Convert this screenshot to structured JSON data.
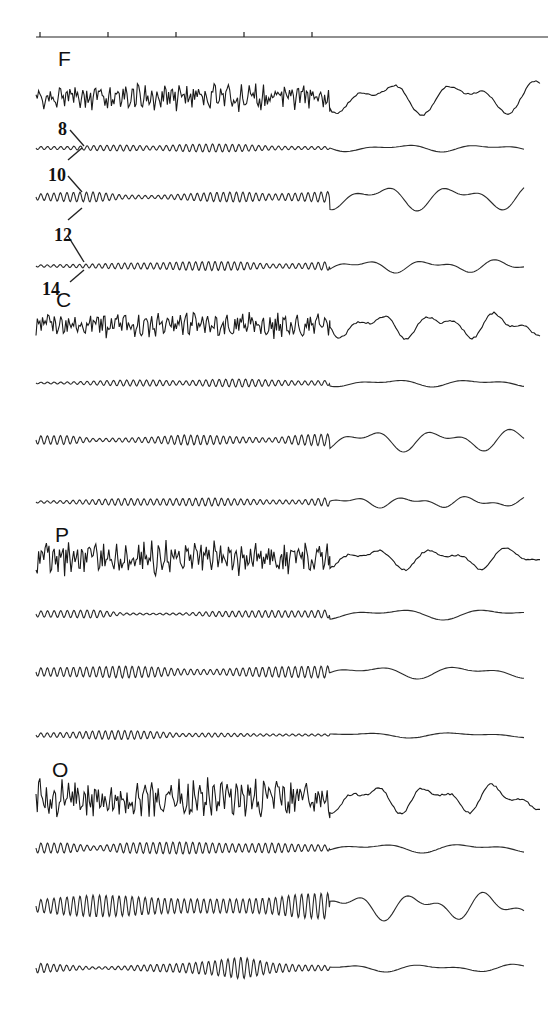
{
  "figure": {
    "time_scale": {
      "x_start": 36,
      "x_end": 548,
      "y": 37,
      "tick_x": [
        40,
        108,
        176,
        244,
        312
      ]
    },
    "band_labels": [
      {
        "text": "8",
        "x": 58,
        "y": 120
      },
      {
        "text": "10",
        "x": 48,
        "y": 166
      },
      {
        "text": "12",
        "x": 54,
        "y": 226
      },
      {
        "text": "14",
        "x": 42,
        "y": 280
      }
    ],
    "band_leader_lines": [
      {
        "x1": 70,
        "y1": 130,
        "x2": 84,
        "y2": 146
      },
      {
        "x1": 68,
        "y1": 160,
        "x2": 82,
        "y2": 148
      },
      {
        "x1": 68,
        "y1": 176,
        "x2": 82,
        "y2": 192
      },
      {
        "x1": 68,
        "y1": 220,
        "x2": 82,
        "y2": 208
      },
      {
        "x1": 68,
        "y1": 236,
        "x2": 84,
        "y2": 262
      },
      {
        "x1": 70,
        "y1": 282,
        "x2": 84,
        "y2": 270
      }
    ],
    "groups": [
      {
        "lead": "F",
        "label_x": 58,
        "label_y": 48,
        "raw_y": 97,
        "raw_amp": 11,
        "raw_seed": 3,
        "slow_wave": {
          "amp": 18,
          "period": 80,
          "phase": 0.6,
          "dotted": true
        },
        "bands": [
          {
            "hz": 8,
            "y": 148,
            "envelope": [
              1.5,
              1.5,
              2.5,
              3,
              2,
              3.5,
              4,
              3.5,
              2,
              1.5,
              1.5
            ],
            "slow_amp": 4,
            "slow_period": 90
          },
          {
            "hz": 10,
            "y": 197,
            "envelope": [
              3,
              4.5,
              5,
              2,
              1.5,
              3,
              4.5,
              5,
              3,
              4,
              5.5
            ],
            "slow_amp": 14,
            "slow_period": 80
          },
          {
            "hz": 12,
            "y": 266,
            "envelope": [
              1,
              1.5,
              2,
              3,
              3,
              4,
              4.5,
              4,
              2,
              2.5,
              4.5
            ],
            "slow_amp": 7,
            "slow_period": 70
          }
        ]
      },
      {
        "lead": "C",
        "label_x": 56,
        "label_y": 289,
        "raw_y": 325,
        "raw_amp": 10,
        "raw_seed": 11,
        "slow_wave": {
          "amp": 14,
          "period": 62,
          "phase": 0.1,
          "dotted": false
        },
        "bands": [
          {
            "hz": 8,
            "y": 383,
            "envelope": [
              0.8,
              1,
              2,
              3,
              3,
              2,
              3.5,
              4,
              3,
              2,
              2.5
            ],
            "slow_amp": 4,
            "slow_period": 90
          },
          {
            "hz": 10,
            "y": 440,
            "envelope": [
              4,
              4.5,
              1.5,
              2,
              3,
              5,
              4.5,
              3,
              2,
              5,
              6
            ],
            "slow_amp": 12,
            "slow_period": 75
          },
          {
            "hz": 12,
            "y": 502,
            "envelope": [
              1,
              1.5,
              2.5,
              3.5,
              3,
              3.5,
              4,
              3,
              2,
              2,
              4.5
            ],
            "slow_amp": 6,
            "slow_period": 60
          }
        ]
      },
      {
        "lead": "P",
        "label_x": 55,
        "label_y": 524,
        "raw_y": 558,
        "raw_amp": 13,
        "raw_seed": 23,
        "slow_wave": {
          "amp": 12,
          "period": 72,
          "phase": 1.4,
          "dotted": true
        },
        "bands": [
          {
            "hz": 8,
            "y": 614,
            "envelope": [
              3,
              3.5,
              4,
              1,
              0.8,
              1,
              2.5,
              3,
              3.5,
              3,
              4
            ],
            "slow_amp": 6,
            "slow_period": 110
          },
          {
            "hz": 10,
            "y": 672,
            "envelope": [
              4,
              4.5,
              5,
              6,
              5,
              3,
              2.5,
              4,
              5,
              5.5,
              6
            ],
            "slow_amp": 7,
            "slow_period": 100
          },
          {
            "hz": 12,
            "y": 735,
            "envelope": [
              2,
              2.5,
              4,
              4.5,
              3.5,
              1.5,
              2,
              1.5,
              1,
              1,
              1
            ],
            "slow_amp": 3,
            "slow_period": 110
          }
        ]
      },
      {
        "lead": "O",
        "label_x": 52,
        "label_y": 759,
        "raw_y": 798,
        "raw_amp": 15,
        "raw_seed": 41,
        "slow_wave": {
          "amp": 16,
          "period": 64,
          "phase": 0.9,
          "dotted": true
        },
        "bands": [
          {
            "hz": 8,
            "y": 848,
            "envelope": [
              5,
              5,
              2,
              5,
              5.5,
              6,
              5,
              4,
              5,
              3.5,
              3
            ],
            "slow_amp": 5,
            "slow_period": 100
          },
          {
            "hz": 10,
            "y": 906,
            "envelope": [
              6,
              9,
              11,
              10,
              8,
              7,
              7,
              7,
              8,
              12,
              13
            ],
            "slow_amp": 15,
            "slow_period": 70
          },
          {
            "hz": 12,
            "y": 968,
            "envelope": [
              5,
              3,
              1,
              2,
              3.5,
              4.5,
              7,
              11,
              5,
              3,
              2.5
            ],
            "slow_amp": 4,
            "slow_period": 90
          }
        ]
      }
    ],
    "layout": {
      "x_start": 36,
      "x_split": 330,
      "x_end": 525,
      "stroke": "#2a2a2a"
    }
  }
}
